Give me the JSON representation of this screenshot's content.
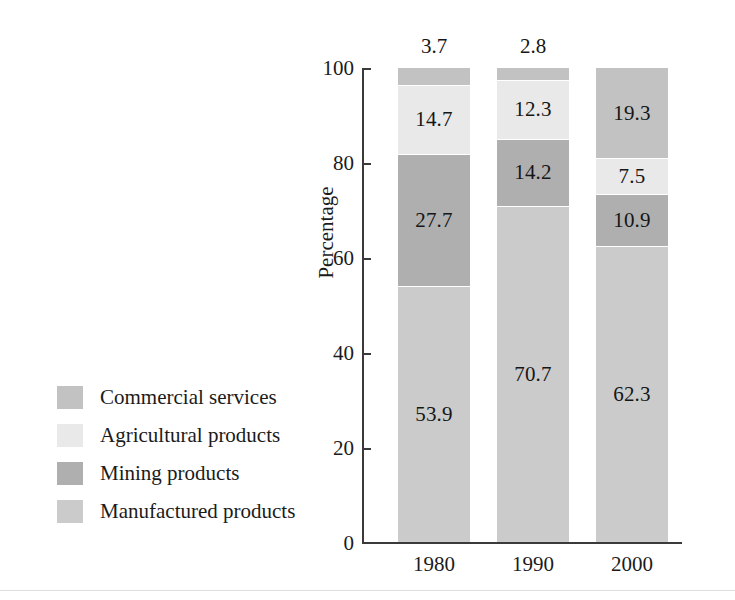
{
  "chart_data": {
    "type": "bar",
    "subtype": "stacked-bar-100",
    "title": "",
    "xlabel": "",
    "ylabel": "Percentage",
    "categories": [
      "1980",
      "1990",
      "2000"
    ],
    "ylim": [
      0,
      100
    ],
    "yticks": [
      0,
      20,
      40,
      60,
      80,
      100
    ],
    "ytick_labels": [
      "0",
      "20",
      "40",
      "60",
      "80",
      "100"
    ],
    "grid": false,
    "legend_position": "left",
    "stack_order_top_to_bottom": [
      "Commercial services",
      "Agricultural products",
      "Mining products",
      "Manufactured products"
    ],
    "series": [
      {
        "name": "Commercial services",
        "color": "#c2c2c2",
        "values": [
          3.7,
          2.8,
          19.3
        ],
        "value_labels": [
          "3.7",
          "2.8",
          "19.3"
        ],
        "label_placement": [
          "above-bar",
          "above-bar",
          "inside"
        ]
      },
      {
        "name": "Agricultural products",
        "color": "#e9e9e9",
        "values": [
          14.7,
          12.3,
          7.5
        ],
        "value_labels": [
          "14.7",
          "12.3",
          "7.5"
        ],
        "label_placement": [
          "inside",
          "inside",
          "inside"
        ]
      },
      {
        "name": "Mining products",
        "color": "#afafaf",
        "values": [
          27.7,
          14.2,
          10.9
        ],
        "value_labels": [
          "27.7",
          "14.2",
          "10.9"
        ],
        "label_placement": [
          "inside",
          "inside",
          "inside"
        ]
      },
      {
        "name": "Manufactured products",
        "color": "#cbcbcb",
        "values": [
          53.9,
          70.7,
          62.3
        ],
        "value_labels": [
          "53.9",
          "70.7",
          "62.3"
        ],
        "label_placement": [
          "inside",
          "inside",
          "inside"
        ]
      }
    ]
  },
  "axis": {
    "y_title": "Percentage",
    "y_tick_labels": [
      "100",
      "80",
      "60",
      "40",
      "20",
      "0"
    ],
    "x_tick_labels": [
      "1980",
      "1990",
      "2000"
    ]
  },
  "legend": {
    "items": [
      {
        "label": "Commercial services",
        "color": "#c2c2c2"
      },
      {
        "label": "Agricultural products",
        "color": "#e9e9e9"
      },
      {
        "label": "Mining products",
        "color": "#afafaf"
      },
      {
        "label": "Manufactured products",
        "color": "#cbcbcb"
      }
    ]
  },
  "bar_top_labels": [
    "3.7",
    "2.8",
    ""
  ]
}
